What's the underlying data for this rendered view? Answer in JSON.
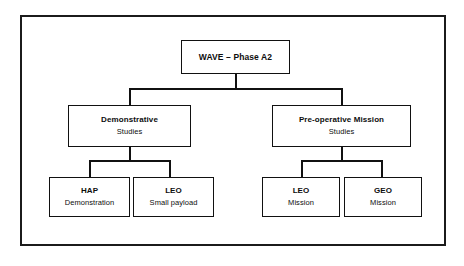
{
  "figure": {
    "type": "organizational-tree",
    "title_node": "WAVE – Phase A2",
    "levels": 3,
    "frame": {
      "border_color": "#1b1b1b",
      "background": "#ffffff"
    }
  },
  "nodes": {
    "root": {
      "id": "wave-phase-a2",
      "line1": "WAVE – Phase A2",
      "line2": ""
    },
    "branch_left": {
      "id": "demonstrative-studies",
      "line1": "Demonstrative",
      "line2": "Studies"
    },
    "branch_right": {
      "id": "pre-operative-mission-studies",
      "line1": "Pre-operative Mission",
      "line2": "Studies"
    },
    "leaf_1": {
      "id": "hap-demonstration",
      "line1": "HAP",
      "line2": "Demonstration"
    },
    "leaf_2": {
      "id": "leo-small-payload",
      "line1": "LEO",
      "line2": "Small payload"
    },
    "leaf_3": {
      "id": "leo-mission",
      "line1": "LEO",
      "line2": "Mission"
    },
    "leaf_4": {
      "id": "geo-mission",
      "line1": "GEO",
      "line2": "Mission"
    }
  },
  "hierarchy": {
    "root": "WAVE – Phase A2",
    "children": [
      {
        "label": "Demonstrative Studies",
        "children": [
          "HAP Demonstration",
          "LEO Small payload"
        ]
      },
      {
        "label": "Pre-operative Mission Studies",
        "children": [
          "LEO Mission",
          "GEO Mission"
        ]
      }
    ]
  },
  "colors": {
    "line": "#111111",
    "frame": "#1b1b1b",
    "text": "#0d0d0d",
    "background": "#ffffff"
  }
}
